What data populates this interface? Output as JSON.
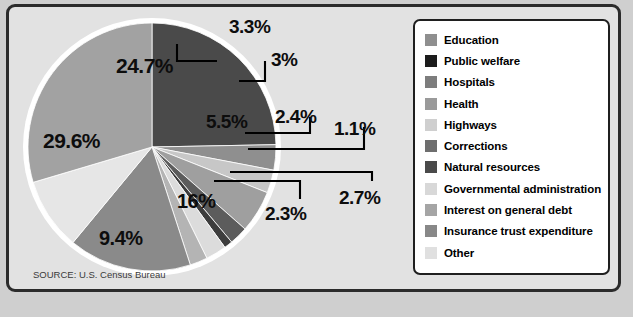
{
  "source_note": "SOURCE: U.S. Census Bureau",
  "colors": {
    "panel_bg": "#e2e2e2",
    "panel_border": "#2b2b2b",
    "legend_bg": "#ffffff",
    "legend_border": "#1f1f1f",
    "pie_outline": "#ffffff",
    "label_text": "#0d0d0d",
    "leader_line": "#000000"
  },
  "legend": {
    "items": [
      {
        "label": "Education",
        "color": "#8f8f8f"
      },
      {
        "label": "Public welfare",
        "color": "#1c1c1c"
      },
      {
        "label": "Hospitals",
        "color": "#7d7d7d"
      },
      {
        "label": "Health",
        "color": "#9a9a9a"
      },
      {
        "label": "Highways",
        "color": "#cfcfcf"
      },
      {
        "label": "Corrections",
        "color": "#6e6e6e"
      },
      {
        "label": "Natural resources",
        "color": "#4a4a4a"
      },
      {
        "label": "Governmental administration",
        "color": "#d8d8d8"
      },
      {
        "label": "Interest on general debt",
        "color": "#a5a5a5"
      },
      {
        "label": "Insurance trust expenditure",
        "color": "#888888"
      },
      {
        "label": "Other",
        "color": "#e0e0e0"
      }
    ]
  },
  "chart_data": {
    "type": "pie",
    "title": "",
    "xlabel": "",
    "ylabel": "",
    "legend_position": "right",
    "grid": false,
    "units": "percent",
    "start_angle_deg": 0,
    "direction": "clockwise",
    "categories": [
      "Education",
      "Hospitals",
      "Health",
      "Highways",
      "Corrections",
      "Natural resources",
      "Governmental administration",
      "Interest on general debt",
      "Insurance trust expenditure",
      "Other",
      "Public welfare"
    ],
    "values": [
      24.7,
      3.3,
      3,
      5.5,
      2.4,
      1.1,
      2.7,
      2.3,
      16,
      9.4,
      29.6
    ],
    "slices": [
      {
        "category": "Education",
        "value": 24.7,
        "label": "24.7%",
        "color": "#4a4a4a",
        "label_placement": "inside"
      },
      {
        "category": "Hospitals",
        "value": 3.3,
        "label": "3.3%",
        "color": "#8f8f8f",
        "label_placement": "callout"
      },
      {
        "category": "Health",
        "value": 3,
        "label": "3%",
        "color": "#c7c7c7",
        "label_placement": "callout"
      },
      {
        "category": "Highways",
        "value": 5.5,
        "label": "5.5%",
        "color": "#9f9f9f",
        "label_placement": "callout"
      },
      {
        "category": "Corrections",
        "value": 2.4,
        "label": "2.4%",
        "color": "#5c5c5c",
        "label_placement": "callout"
      },
      {
        "category": "Natural resources",
        "value": 1.1,
        "label": "1.1%",
        "color": "#3d3d3d",
        "label_placement": "callout"
      },
      {
        "category": "Governmental administration",
        "value": 2.7,
        "label": "2.7%",
        "color": "#dcdcdc",
        "label_placement": "callout"
      },
      {
        "category": "Interest on general debt",
        "value": 2.3,
        "label": "2.3%",
        "color": "#b4b4b4",
        "label_placement": "callout"
      },
      {
        "category": "Insurance trust expenditure",
        "value": 16,
        "label": "16%",
        "color": "#8a8a8a",
        "label_placement": "inside"
      },
      {
        "category": "Other",
        "value": 9.4,
        "label": "9.4%",
        "color": "#e6e6e6",
        "label_placement": "inside"
      },
      {
        "category": "Public welfare",
        "value": 29.6,
        "label": "29.6%",
        "color": "#a2a2a2",
        "label_placement": "inside"
      }
    ]
  }
}
